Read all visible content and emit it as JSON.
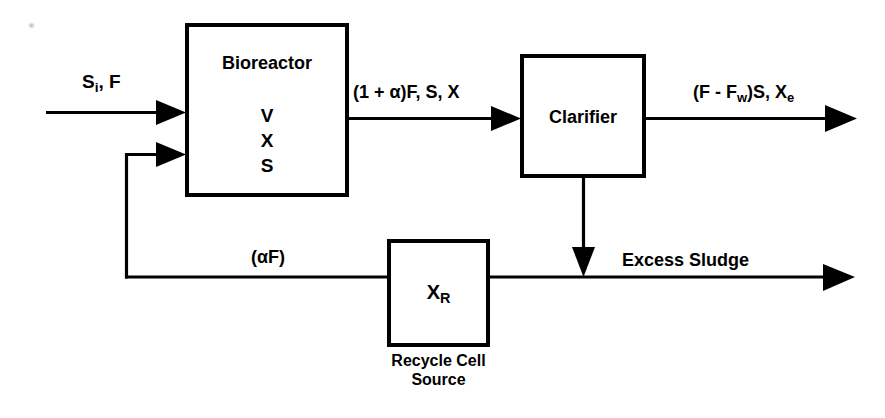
{
  "diagram": {
    "stroke_color": "#000000",
    "background_color": "#ffffff"
  },
  "blocks": {
    "bioreactor": {
      "title": "Bioreactor",
      "contents": [
        "V",
        "X",
        "S"
      ]
    },
    "clarifier": {
      "title": "Clarifier"
    },
    "recycle": {
      "symbol_base": "X",
      "symbol_sub": "R",
      "caption_line1": "Recycle Cell",
      "caption_line2": "Source"
    }
  },
  "streams": {
    "feed": {
      "label_base": "S",
      "label_sub": "i",
      "label_rest": ", F"
    },
    "bioreactor_outlet": {
      "label": "(1 + α)F, S, X"
    },
    "clarifier_effluent": {
      "label_part1": "(F - F",
      "label_sub1": "w",
      "label_part2": ")S, X",
      "label_sub2": "e"
    },
    "recycle_flow": {
      "label": "(αF)"
    },
    "excess_sludge": {
      "label": "Excess Sludge"
    }
  }
}
